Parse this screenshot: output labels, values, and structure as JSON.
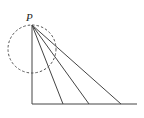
{
  "diagram": {
    "point_label": "P",
    "colors": {
      "stroke": "#444444",
      "background": "#ffffff"
    },
    "point": {
      "x": 32,
      "y": 25
    },
    "circle": {
      "cx": 32,
      "cy": 49,
      "r": 24,
      "style": "dashed"
    },
    "vertical_line": {
      "x1": 32,
      "y1": 25,
      "x2": 32,
      "y2": 104
    },
    "baseline": {
      "x1": 32,
      "y1": 104,
      "x2": 137,
      "y2": 104
    },
    "rays": [
      {
        "x2": 63,
        "y2": 104
      },
      {
        "x2": 89,
        "y2": 104
      },
      {
        "x2": 121,
        "y2": 104
      }
    ]
  }
}
